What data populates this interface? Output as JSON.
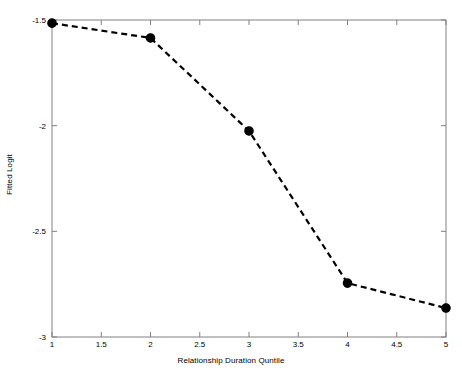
{
  "chart_data": {
    "type": "line",
    "title": "",
    "subtitle": "",
    "xlabel": "Relationship Duration Quntile",
    "ylabel": "Fitted Logit",
    "x": [
      1,
      2,
      3,
      4,
      5
    ],
    "values": [
      -1.515,
      -1.585,
      -2.025,
      -2.745,
      -2.863
    ],
    "series": [
      {
        "name": "Fitted Logit",
        "x": [
          1,
          2,
          3,
          4,
          5
        ],
        "values": [
          -1.515,
          -1.585,
          -2.025,
          -2.745,
          -2.863
        ]
      }
    ],
    "xlim": [
      1,
      5
    ],
    "ylim": [
      -3,
      -1.5
    ],
    "xticks": [
      1,
      1.5,
      2,
      2.5,
      3,
      3.5,
      4,
      4.5,
      5
    ],
    "xticklabels": [
      "1",
      "1.5",
      "2",
      "2.5",
      "3",
      "3.5",
      "4",
      "4.5",
      "5"
    ],
    "yticks": [
      -1.5,
      -2,
      -2.5,
      -3
    ],
    "yticklabels": [
      "-1.5",
      "-2",
      "-2.5",
      "-3"
    ],
    "grid": false,
    "legend": null,
    "legend_position": "none",
    "line_style": "dashed",
    "marker": "circle-filled",
    "line_color": "#000000",
    "marker_color": "#000000",
    "axes_color": "#808080",
    "background_color": "#ffffff",
    "annotations": []
  },
  "axes": {
    "x_title": "Relationship Duration Quntile",
    "y_title": "Fitted Logit"
  }
}
